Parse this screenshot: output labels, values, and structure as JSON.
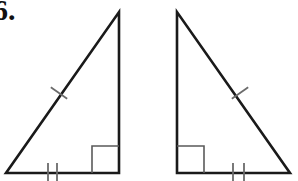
{
  "page": {
    "background_color": "#ffffff",
    "width": 298,
    "height": 181,
    "kind": "geometry-worksheet-figure"
  },
  "problem": {
    "number_label": "6.",
    "description": "Two congruent right triangles shown as mirror images, marked with congruence tick marks"
  },
  "style": {
    "stroke_color": "#1a1a1a",
    "tick_color": "#6b6b6b",
    "right_angle_color": "#5a5a5a",
    "stroke_width": 2.6,
    "tick_width": 1.8,
    "right_angle_width": 1.6
  },
  "figures": [
    {
      "name": "left-triangle",
      "orientation": "right-angle-at-bottom-right",
      "vertices": {
        "apex": {
          "x": 119,
          "y": 12
        },
        "bottom_right": {
          "x": 119,
          "y": 173
        },
        "bottom_left": {
          "x": 6,
          "y": 173
        }
      },
      "right_angle_marker": {
        "corner": "bottom-right",
        "x": 92,
        "y": 146,
        "size": 27
      },
      "tick_marks": {
        "hypotenuse": {
          "count": 1,
          "center_x": 59,
          "center_y": 93,
          "length": 20
        },
        "base": {
          "count": 2,
          "positions_x": [
            48,
            57
          ],
          "center_y": 173,
          "length": 20
        }
      }
    },
    {
      "name": "right-triangle",
      "orientation": "right-angle-at-bottom-left",
      "vertices": {
        "apex": {
          "x": 177,
          "y": 12
        },
        "bottom_left": {
          "x": 177,
          "y": 173
        },
        "bottom_right": {
          "x": 290,
          "y": 173
        }
      },
      "right_angle_marker": {
        "corner": "bottom-left",
        "x": 177,
        "y": 146,
        "size": 27
      },
      "tick_marks": {
        "hypotenuse": {
          "count": 1,
          "center_x": 240,
          "center_y": 93,
          "length": 20
        },
        "base": {
          "count": 2,
          "positions_x": [
            233,
            244
          ],
          "center_y": 173,
          "length": 20
        }
      }
    }
  ]
}
